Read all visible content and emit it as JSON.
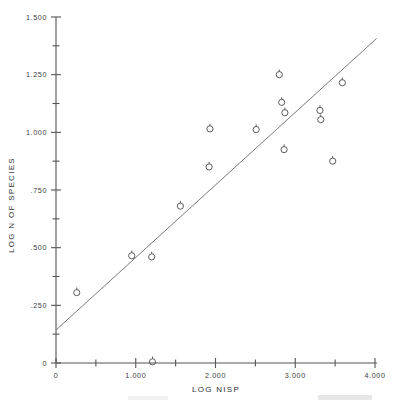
{
  "chart_data": {
    "type": "scatter",
    "title": "",
    "xlabel": "LOG NISP",
    "ylabel": "LOG N OF SPECIES",
    "xlim": [
      0,
      4.0
    ],
    "ylim": [
      0,
      1.5
    ],
    "grid": false,
    "legend": null,
    "x_ticks": [
      0,
      0.5,
      1.0,
      1.5,
      2.0,
      2.5,
      3.0,
      3.5,
      4.0
    ],
    "x_tick_labels": [
      "0",
      "",
      "1.000",
      "",
      "2.000",
      "",
      "3.000",
      "",
      "4.000"
    ],
    "y_ticks": [
      0,
      0.125,
      0.25,
      0.375,
      0.5,
      0.625,
      0.75,
      0.875,
      1.0,
      1.125,
      1.25,
      1.375,
      1.5
    ],
    "y_tick_labels": [
      "0",
      "",
      ".250",
      "",
      ".500",
      "",
      ".750",
      "",
      "1.000",
      "",
      "1.250",
      "",
      "1.500"
    ],
    "marker": "circle-with-stem",
    "points": [
      {
        "x": 0.26,
        "y": 0.305
      },
      {
        "x": 0.95,
        "y": 0.465
      },
      {
        "x": 1.2,
        "y": 0.46
      },
      {
        "x": 1.21,
        "y": 0.005
      },
      {
        "x": 1.56,
        "y": 0.68
      },
      {
        "x": 1.92,
        "y": 0.85
      },
      {
        "x": 1.93,
        "y": 1.015
      },
      {
        "x": 2.51,
        "y": 1.012
      },
      {
        "x": 2.8,
        "y": 1.25
      },
      {
        "x": 2.83,
        "y": 1.13
      },
      {
        "x": 2.87,
        "y": 1.085
      },
      {
        "x": 2.86,
        "y": 0.925
      },
      {
        "x": 3.31,
        "y": 1.095
      },
      {
        "x": 3.32,
        "y": 1.055
      },
      {
        "x": 3.47,
        "y": 0.875
      },
      {
        "x": 3.59,
        "y": 1.215
      }
    ],
    "fit_line": {
      "label": "regression line",
      "x_start": 0.0,
      "y_start": 0.143,
      "x_end": 4.02,
      "y_end": 1.407
    }
  },
  "axis_titles": {
    "x": "LOG NISP",
    "y": "LOG N OF SPECIES"
  }
}
